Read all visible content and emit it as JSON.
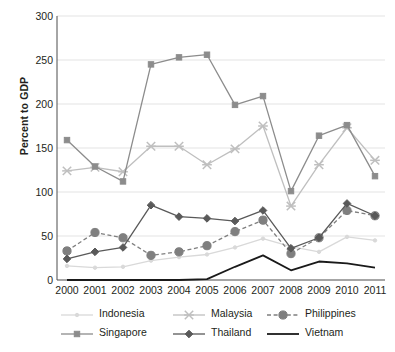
{
  "chart_data": {
    "type": "line",
    "title": "",
    "xlabel": "",
    "ylabel": "Percent to GDP",
    "ylim": [
      0,
      300
    ],
    "yticks": [
      0,
      50,
      100,
      150,
      200,
      250,
      300
    ],
    "grid": true,
    "legend_position": "bottom",
    "categories": [
      "2000",
      "2001",
      "2002",
      "2003",
      "2004",
      "2005",
      "2006",
      "2007",
      "2008",
      "2009",
      "2010",
      "2011"
    ],
    "series": [
      {
        "name": "Indonesia",
        "color": "#d9d9d9",
        "marker": "dot",
        "dash": "solid",
        "values": [
          16,
          14,
          15,
          22,
          26,
          29,
          37,
          47,
          38,
          32,
          49,
          45
        ]
      },
      {
        "name": "Malaysia",
        "color": "#bfbfbf",
        "marker": "asterisk",
        "dash": "solid",
        "values": [
          124,
          128,
          123,
          152,
          152,
          131,
          149,
          175,
          84,
          131,
          173,
          136
        ]
      },
      {
        "name": "Philippines",
        "color": "#7f7f7f",
        "marker": "circle",
        "dash": "dashed",
        "values": [
          33,
          54,
          48,
          28,
          32,
          39,
          55,
          68,
          30,
          48,
          79,
          73
        ]
      },
      {
        "name": "Singapore",
        "color": "#8c8c8c",
        "marker": "square",
        "dash": "solid",
        "values": [
          159,
          129,
          112,
          245,
          253,
          256,
          199,
          209,
          101,
          164,
          176,
          118
        ]
      },
      {
        "name": "Thailand",
        "color": "#595959",
        "marker": "diamond",
        "dash": "solid",
        "values": [
          24,
          32,
          37,
          85,
          72,
          70,
          67,
          79,
          36,
          48,
          87,
          73
        ]
      },
      {
        "name": "Vietnam",
        "color": "#1a1a1a",
        "marker": "none",
        "dash": "solid",
        "values": [
          0,
          0,
          0,
          0,
          0,
          1,
          15,
          28,
          11,
          21,
          19,
          14
        ]
      }
    ]
  },
  "legend": {
    "rows": [
      [
        "Indonesia",
        "Malaysia",
        "Philippines"
      ],
      [
        "Singapore",
        "Thailand",
        "Vietnam"
      ]
    ]
  }
}
